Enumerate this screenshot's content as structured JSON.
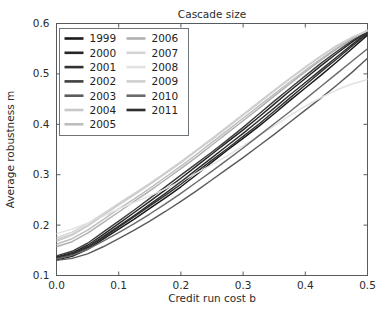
{
  "chart_data": {
    "type": "line",
    "title": "Cascade size",
    "xlabel": "Credit run cost b",
    "ylabel": "Average robustness m",
    "xlim": [
      0.0,
      0.5
    ],
    "ylim": [
      0.1,
      0.6
    ],
    "xticks": [
      0.0,
      0.1,
      0.2,
      0.3,
      0.4,
      0.5
    ],
    "xtick_labels": [
      "0.0",
      "0.1",
      "0.2",
      "0.3",
      "0.4",
      "0.5"
    ],
    "yticks": [
      0.1,
      0.2,
      0.3,
      0.4,
      0.5,
      0.6
    ],
    "ytick_labels": [
      "0.1",
      "0.2",
      "0.3",
      "0.4",
      "0.5",
      "0.6"
    ],
    "grid": false,
    "legend_position": "upper left",
    "legend_columns": 2,
    "colormap": "grayscale",
    "x": [
      0.0,
      0.025,
      0.05,
      0.075,
      0.1,
      0.125,
      0.15,
      0.175,
      0.2,
      0.225,
      0.25,
      0.275,
      0.3,
      0.325,
      0.35,
      0.375,
      0.4,
      0.425,
      0.45,
      0.475,
      0.5
    ],
    "series": [
      {
        "name": "1999",
        "color": "#1a1a1a",
        "values": [
          0.131,
          0.138,
          0.152,
          0.172,
          0.192,
          0.212,
          0.233,
          0.254,
          0.276,
          0.3,
          0.325,
          0.349,
          0.372,
          0.396,
          0.421,
          0.447,
          0.472,
          0.497,
          0.523,
          0.55,
          0.577
        ]
      },
      {
        "name": "2000",
        "color": "#262626",
        "values": [
          0.137,
          0.145,
          0.16,
          0.181,
          0.203,
          0.225,
          0.247,
          0.27,
          0.293,
          0.317,
          0.341,
          0.365,
          0.389,
          0.414,
          0.44,
          0.466,
          0.491,
          0.516,
          0.54,
          0.563,
          0.584
        ]
      },
      {
        "name": "2001",
        "color": "#323232",
        "values": [
          0.134,
          0.141,
          0.155,
          0.175,
          0.196,
          0.217,
          0.238,
          0.259,
          0.281,
          0.305,
          0.329,
          0.352,
          0.376,
          0.4,
          0.426,
          0.452,
          0.478,
          0.504,
          0.529,
          0.555,
          0.58
        ]
      },
      {
        "name": "2002",
        "color": "#3f3f3f",
        "values": [
          0.139,
          0.148,
          0.164,
          0.186,
          0.208,
          0.23,
          0.253,
          0.276,
          0.299,
          0.322,
          0.345,
          0.369,
          0.394,
          0.42,
          0.446,
          0.471,
          0.496,
          0.521,
          0.544,
          0.566,
          0.586
        ]
      },
      {
        "name": "2003",
        "color": "#5c5c5c",
        "values": [
          0.13,
          0.134,
          0.143,
          0.157,
          0.173,
          0.19,
          0.208,
          0.227,
          0.247,
          0.268,
          0.29,
          0.312,
          0.334,
          0.357,
          0.38,
          0.404,
          0.428,
          0.452,
          0.477,
          0.503,
          0.531
        ]
      },
      {
        "name": "2004",
        "color": "#c8c8c8",
        "values": [
          0.168,
          0.18,
          0.198,
          0.219,
          0.24,
          0.26,
          0.281,
          0.302,
          0.324,
          0.347,
          0.37,
          0.394,
          0.418,
          0.442,
          0.466,
          0.49,
          0.513,
          0.535,
          0.555,
          0.572,
          0.585
        ]
      },
      {
        "name": "2005",
        "color": "#bdbdbd",
        "values": [
          0.162,
          0.173,
          0.19,
          0.211,
          0.232,
          0.252,
          0.273,
          0.295,
          0.317,
          0.34,
          0.364,
          0.388,
          0.412,
          0.436,
          0.46,
          0.484,
          0.507,
          0.53,
          0.551,
          0.57,
          0.586
        ]
      },
      {
        "name": "2006",
        "color": "#b0b0b0",
        "values": [
          0.157,
          0.167,
          0.184,
          0.205,
          0.226,
          0.247,
          0.268,
          0.29,
          0.312,
          0.335,
          0.359,
          0.383,
          0.407,
          0.431,
          0.456,
          0.48,
          0.504,
          0.527,
          0.549,
          0.569,
          0.587
        ]
      },
      {
        "name": "2007",
        "color": "#d4d4d4",
        "values": [
          0.175,
          0.186,
          0.203,
          0.223,
          0.243,
          0.263,
          0.283,
          0.304,
          0.326,
          0.349,
          0.372,
          0.396,
          0.42,
          0.444,
          0.468,
          0.491,
          0.514,
          0.536,
          0.556,
          0.573,
          0.586
        ]
      },
      {
        "name": "2008",
        "color": "#e2e2e2",
        "values": [
          0.183,
          0.192,
          0.204,
          0.218,
          0.232,
          0.245,
          0.258,
          0.272,
          0.287,
          0.303,
          0.32,
          0.338,
          0.357,
          0.377,
          0.397,
          0.417,
          0.436,
          0.453,
          0.468,
          0.48,
          0.489
        ]
      },
      {
        "name": "2009",
        "color": "#cfcfcf",
        "values": [
          0.171,
          0.182,
          0.199,
          0.22,
          0.241,
          0.261,
          0.282,
          0.303,
          0.325,
          0.348,
          0.371,
          0.395,
          0.419,
          0.443,
          0.467,
          0.49,
          0.513,
          0.535,
          0.555,
          0.572,
          0.586
        ]
      },
      {
        "name": "2010",
        "color": "#6b6b6b",
        "values": [
          0.133,
          0.14,
          0.152,
          0.168,
          0.185,
          0.203,
          0.222,
          0.242,
          0.263,
          0.285,
          0.307,
          0.33,
          0.353,
          0.377,
          0.401,
          0.425,
          0.45,
          0.475,
          0.5,
          0.525,
          0.55
        ]
      },
      {
        "name": "2011",
        "color": "#2e2e2e",
        "values": [
          0.136,
          0.143,
          0.157,
          0.177,
          0.198,
          0.219,
          0.241,
          0.263,
          0.286,
          0.31,
          0.334,
          0.358,
          0.382,
          0.407,
          0.432,
          0.458,
          0.483,
          0.508,
          0.533,
          0.558,
          0.582
        ]
      }
    ]
  },
  "legend": {
    "entries": [
      {
        "label": "1999"
      },
      {
        "label": "2000"
      },
      {
        "label": "2001"
      },
      {
        "label": "2002"
      },
      {
        "label": "2003"
      },
      {
        "label": "2004"
      },
      {
        "label": "2005"
      },
      {
        "label": "2006"
      },
      {
        "label": "2007"
      },
      {
        "label": "2008"
      },
      {
        "label": "2009"
      },
      {
        "label": "2010"
      },
      {
        "label": "2011"
      }
    ]
  }
}
